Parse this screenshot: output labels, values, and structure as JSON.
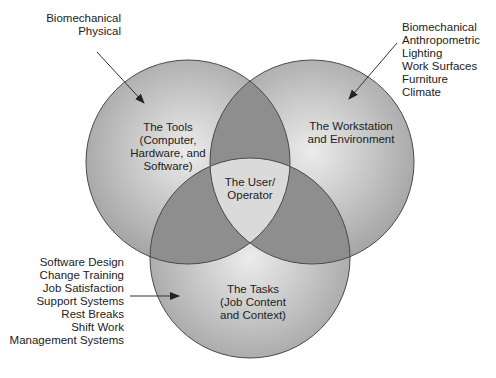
{
  "diagram": {
    "type": "venn",
    "colors": {
      "circle_center": "#ececec",
      "circle_edge": "#a4a4a4",
      "pair_overlap": "#8e8e8e",
      "triple_overlap": "#dadada",
      "stroke": "#4a4a4a",
      "text": "#222222"
    },
    "circles": [
      {
        "id": "tools",
        "cx": 188,
        "cy": 162,
        "r": 102,
        "label_lines": [
          "The Tools",
          "(Computer,",
          "Hardware, and",
          "Software)"
        ],
        "annotation_lines": [
          "Biomechanical",
          "Physical"
        ]
      },
      {
        "id": "workstation",
        "cx": 312,
        "cy": 162,
        "r": 102,
        "label_lines": [
          "The Workstation",
          "and Environment"
        ],
        "annotation_lines": [
          "Biomechanical",
          "Anthropometric",
          "Lighting",
          "Work Surfaces",
          "Furniture",
          "Climate"
        ]
      },
      {
        "id": "tasks",
        "cx": 250,
        "cy": 258,
        "r": 100,
        "label_lines": [
          "The Tasks",
          "(Job Content",
          "and Context)"
        ],
        "annotation_lines": [
          "Software Design",
          "Change Training",
          "Job Satisfaction",
          "Support Systems",
          "Rest Breaks",
          "Shift Work",
          "Management Systems"
        ]
      }
    ],
    "center": {
      "label_lines": [
        "The User/",
        "Operator"
      ]
    },
    "arrows": [
      {
        "from": [
          97,
          52
        ],
        "to": [
          144,
          103
        ],
        "target": "tools"
      },
      {
        "from": [
          397,
          43
        ],
        "to": [
          349,
          99
        ],
        "target": "workstation"
      },
      {
        "from": [
          130,
          296
        ],
        "to": [
          179,
          296
        ],
        "target": "tasks"
      }
    ]
  }
}
